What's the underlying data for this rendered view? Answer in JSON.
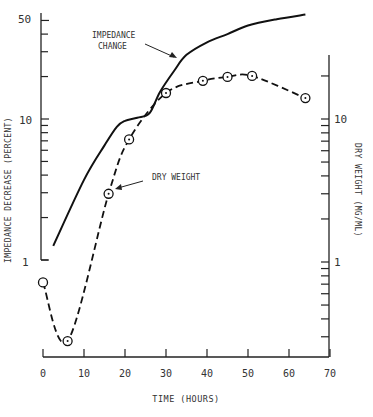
{
  "chart_data": {
    "type": "line",
    "title": "",
    "xlabel": "TIME (HOURS)",
    "ylabel": "IMPEDANCE DECREASE (PERCENT)",
    "y2label": "DRY WEIGHT (MG/ML)",
    "xlim": [
      0,
      70
    ],
    "xticks": [
      0,
      10,
      20,
      30,
      40,
      50,
      60,
      70
    ],
    "yscale": "log",
    "ylim": [
      1,
      50
    ],
    "yticks_labeled": [
      1,
      10,
      50
    ],
    "y2scale": "log",
    "y2lim": [
      0.22,
      28
    ],
    "y2ticks_labeled": [
      1,
      10
    ],
    "grid": false,
    "annotations": [
      {
        "text": "IMPEDANCE CHANGE",
        "points_to": "impedance_change_curve"
      },
      {
        "text": "DRY WEIGHT",
        "points_to": "dry_weight_point_t16"
      }
    ],
    "series": [
      {
        "name": "Impedance change",
        "axis": "left",
        "style": "solid",
        "markers": false,
        "x": [
          2.5,
          10,
          15,
          18,
          20,
          23,
          26,
          28.5,
          32,
          35,
          40,
          45,
          50,
          57,
          64
        ],
        "values": [
          1.26,
          3.7,
          6.5,
          8.8,
          9.7,
          10.2,
          11.0,
          15.5,
          22,
          28.5,
          35,
          40,
          46,
          51,
          55
        ]
      },
      {
        "name": "Dry weight",
        "axis": "right",
        "style": "dashed",
        "markers": true,
        "x": [
          0,
          6,
          16,
          21,
          30,
          39,
          45,
          51,
          64
        ],
        "values": [
          0.72,
          0.28,
          3.0,
          7.2,
          15.2,
          18.5,
          19.7,
          20.0,
          14.0
        ]
      }
    ]
  },
  "labels": {
    "impedance_annotation_line1": "IMPEDANCE",
    "impedance_annotation_line2": "CHANGE",
    "dry_weight_annotation": "DRY WEIGHT",
    "x_axis_title": "TIME (HOURS)",
    "left_axis_title": "IMPEDANCE DECREASE (PERCENT)",
    "right_axis_title": "DRY WEIGHT (MG/ML)",
    "left_tick_50": "50",
    "left_tick_10": "10",
    "left_tick_1": "1",
    "right_tick_10": "10",
    "right_tick_1": "1",
    "x_ticks": [
      "0",
      "10",
      "20",
      "30",
      "40",
      "50",
      "60",
      "70"
    ]
  }
}
